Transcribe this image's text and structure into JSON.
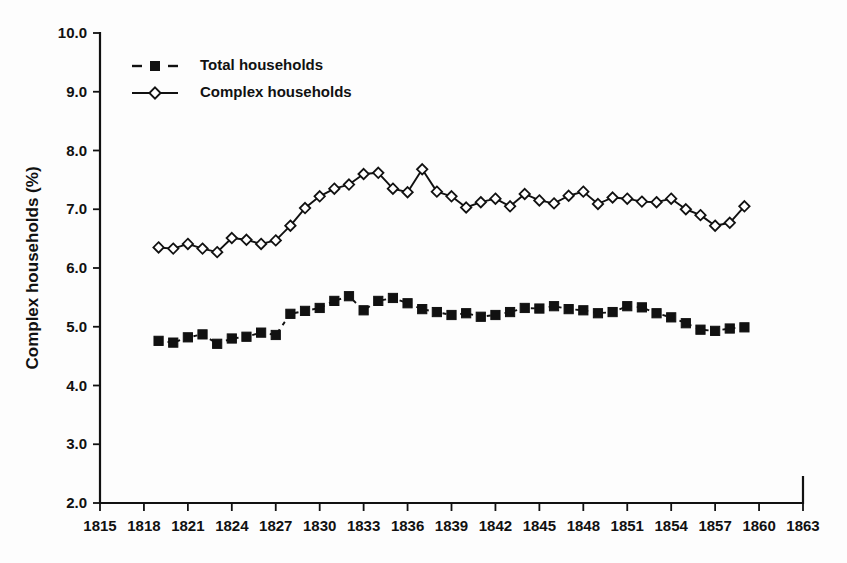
{
  "chart_data": {
    "type": "line",
    "title": "",
    "subtitle": "",
    "xlabel": "",
    "ylabel": "Complex households (%)",
    "xlim": [
      1815,
      1863
    ],
    "ylim": [
      2.0,
      10.0
    ],
    "grid": false,
    "legend_position": "top-left",
    "xticks": [
      1815,
      1818,
      1821,
      1824,
      1827,
      1830,
      1833,
      1836,
      1839,
      1842,
      1845,
      1848,
      1851,
      1854,
      1857,
      1860,
      1863
    ],
    "yticks": [
      "2.0",
      "3.0",
      "4.0",
      "5.0",
      "6.0",
      "7.0",
      "8.0",
      "9.0",
      "10.0"
    ],
    "x": [
      1819,
      1820,
      1821,
      1822,
      1823,
      1824,
      1825,
      1826,
      1827,
      1828,
      1829,
      1830,
      1831,
      1832,
      1833,
      1834,
      1835,
      1836,
      1837,
      1838,
      1839,
      1840,
      1841,
      1842,
      1843,
      1844,
      1845,
      1846,
      1847,
      1848,
      1849,
      1850,
      1851,
      1852,
      1853,
      1854,
      1855,
      1856,
      1857,
      1858,
      1859
    ],
    "series": [
      {
        "name": "Total households",
        "marker": "filled-square",
        "line_style": "dashed",
        "color": "#111111",
        "values": [
          4.76,
          4.73,
          4.82,
          4.87,
          4.71,
          4.8,
          4.83,
          4.9,
          4.86,
          5.22,
          5.27,
          5.32,
          5.44,
          5.52,
          5.28,
          5.44,
          5.49,
          5.4,
          5.3,
          5.25,
          5.2,
          5.23,
          5.17,
          5.2,
          5.25,
          5.32,
          5.31,
          5.35,
          5.3,
          5.28,
          5.23,
          5.25,
          5.35,
          5.33,
          5.23,
          5.16,
          5.06,
          4.95,
          4.93,
          4.97,
          4.99
        ]
      },
      {
        "name": "Complex households",
        "marker": "open-diamond",
        "line_style": "solid",
        "color": "#111111",
        "values": [
          6.35,
          6.33,
          6.41,
          6.33,
          6.27,
          6.51,
          6.48,
          6.41,
          6.47,
          6.72,
          7.02,
          7.22,
          7.35,
          7.42,
          7.6,
          7.62,
          7.35,
          7.29,
          7.68,
          7.3,
          7.22,
          7.03,
          7.12,
          7.18,
          7.05,
          7.26,
          7.15,
          7.1,
          7.23,
          7.3,
          7.09,
          7.2,
          7.18,
          7.13,
          7.12,
          7.18,
          7.0,
          6.9,
          6.72,
          6.77,
          7.05
        ]
      }
    ]
  },
  "legend": {
    "items": [
      {
        "label": "Total households"
      },
      {
        "label": "Complex households"
      }
    ]
  },
  "axes": {
    "y_title": "Complex households (%)"
  }
}
